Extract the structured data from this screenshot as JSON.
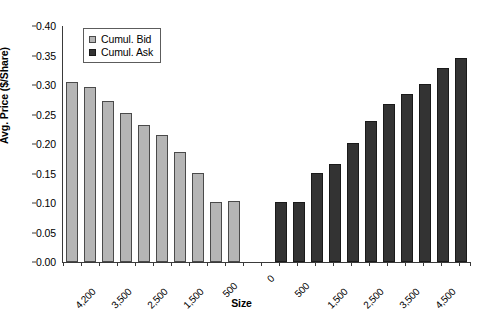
{
  "chart_data": {
    "type": "bar",
    "title": "",
    "subtitle": "",
    "xlabel": "Size",
    "ylabel": "Avg. Price ($/Share)",
    "ylim": [
      0.0,
      0.4
    ],
    "ytick_labels": [
      "0.00",
      "0.05",
      "0.10",
      "0.15",
      "0.20",
      "0.25",
      "0.30",
      "0.35",
      "0.40"
    ],
    "ytick_values": [
      0.0,
      0.05,
      0.1,
      0.15,
      0.2,
      0.25,
      0.3,
      0.35,
      0.4
    ],
    "grid": false,
    "legend_position": "top-left",
    "legend": [
      {
        "name": "Cumul. Bid",
        "color": "#b5b5b5"
      },
      {
        "name": "Cumul. Ask",
        "color": "#333333"
      }
    ],
    "xtick_labels": [
      "4,200",
      "3,500",
      "2,500",
      "1,500",
      "500",
      "0",
      "500",
      "1,500",
      "2,500",
      "3,500",
      "4,500"
    ],
    "series": [
      {
        "name": "Cumul. Bid",
        "color": "#b5b5b5",
        "categories": [
          "4,500",
          "4,200",
          "3,700",
          "3,200",
          "2,700",
          "2,200",
          "1,700",
          "1,200",
          "700",
          "300",
          "100"
        ],
        "values": [
          0.305,
          0.296,
          0.273,
          0.252,
          0.232,
          0.216,
          0.187,
          0.151,
          0.102,
          0.103
        ]
      },
      {
        "name": "Cumul. Ask",
        "color": "#333333",
        "categories": [
          "100",
          "300",
          "700",
          "1,200",
          "1,700",
          "2,200",
          "2,700",
          "3,200",
          "3,700",
          "4,200",
          "4,700"
        ],
        "values": [
          0.102,
          0.101,
          0.151,
          0.166,
          0.201,
          0.239,
          0.268,
          0.285,
          0.302,
          0.328,
          0.345
        ]
      }
    ]
  }
}
